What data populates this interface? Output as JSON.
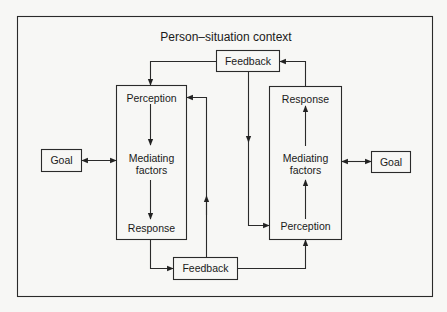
{
  "diagram": {
    "title": "Person–situation context",
    "left": {
      "goal": "Goal",
      "perception": "Perception",
      "mediating_line1": "Mediating",
      "mediating_line2": "factors",
      "response": "Response"
    },
    "right": {
      "goal": "Goal",
      "response": "Response",
      "mediating_line1": "Mediating",
      "mediating_line2": "factors",
      "perception": "Perception"
    },
    "feedback_top": "Feedback",
    "feedback_bottom": "Feedback",
    "colors": {
      "line": "#2a2a2a",
      "background": "#f7f7f5"
    }
  }
}
